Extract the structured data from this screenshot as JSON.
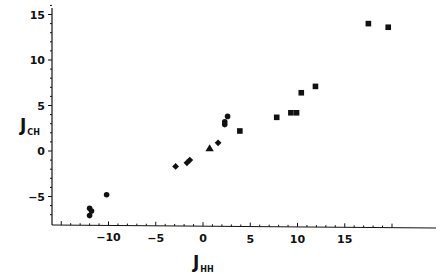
{
  "chart_data": {
    "type": "scatter",
    "title": "",
    "xlabel": "J_HH",
    "ylabel": "J_CH",
    "xlabel_main": "J",
    "xlabel_sub": "HH",
    "ylabel_main": "J",
    "ylabel_sub": "CH",
    "xlim": [
      -16,
      24
    ],
    "ylim": [
      -8,
      16
    ],
    "x_ticks": [
      -10,
      -5,
      0,
      5,
      10,
      15
    ],
    "x_tick_labels": [
      "−10",
      "−5",
      "0",
      "5",
      "10",
      "15"
    ],
    "y_ticks": [
      -5,
      0,
      5,
      10,
      15
    ],
    "y_tick_labels": [
      "−5",
      "0",
      "5",
      "10",
      "15"
    ],
    "grid": false,
    "legend": null,
    "series": [
      {
        "name": "circles",
        "marker": "circle",
        "points": [
          {
            "x": -12.0,
            "y": -6.3
          },
          {
            "x": -11.8,
            "y": -6.6
          },
          {
            "x": -12.0,
            "y": -7.1
          },
          {
            "x": -10.2,
            "y": -4.8
          },
          {
            "x": 2.6,
            "y": 3.8
          },
          {
            "x": 2.3,
            "y": 3.2
          },
          {
            "x": 2.3,
            "y": 2.9
          }
        ]
      },
      {
        "name": "diamonds",
        "marker": "diamond",
        "points": [
          {
            "x": -2.9,
            "y": -1.7
          },
          {
            "x": -1.7,
            "y": -1.3
          },
          {
            "x": -1.4,
            "y": -1.0
          },
          {
            "x": 1.6,
            "y": 0.9
          }
        ]
      },
      {
        "name": "triangles",
        "marker": "triangle",
        "points": [
          {
            "x": 0.7,
            "y": 0.3
          }
        ]
      },
      {
        "name": "squares",
        "marker": "square",
        "points": [
          {
            "x": 3.9,
            "y": 2.2
          },
          {
            "x": 7.8,
            "y": 3.7
          },
          {
            "x": 9.3,
            "y": 4.2
          },
          {
            "x": 9.9,
            "y": 4.2
          },
          {
            "x": 10.4,
            "y": 6.4
          },
          {
            "x": 11.9,
            "y": 7.1
          },
          {
            "x": 17.5,
            "y": 14.0
          },
          {
            "x": 19.6,
            "y": 13.6
          }
        ]
      }
    ]
  },
  "colors": {
    "ink": "#111111",
    "background": "#ffffff"
  }
}
